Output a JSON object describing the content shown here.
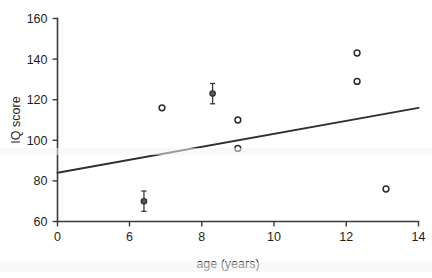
{
  "chart_data": {
    "type": "scatter",
    "title": "",
    "xlabel": "age (years)",
    "ylabel": "IQ score",
    "xlim": [
      0,
      14
    ],
    "ylim": [
      60,
      160
    ],
    "grid": false,
    "legend": "none",
    "x_axis_break": true,
    "xticks": [
      {
        "value": 0,
        "label": "0"
      },
      {
        "value": 6,
        "label": "6"
      },
      {
        "value": 8,
        "label": "8"
      },
      {
        "value": 10,
        "label": "10"
      },
      {
        "value": 12,
        "label": "12"
      },
      {
        "value": 14,
        "label": "14"
      }
    ],
    "yticks": [
      {
        "value": 160,
        "label": "160"
      },
      {
        "value": 140,
        "label": "140"
      },
      {
        "value": 120,
        "label": "120"
      },
      {
        "value": 100,
        "label": "100"
      },
      {
        "value": 80,
        "label": "80"
      },
      {
        "value": 60,
        "label": "60"
      }
    ],
    "series": [
      {
        "name": "observations",
        "marker": "open-circle",
        "points": [
          {
            "x": 6.9,
            "y": 116
          },
          {
            "x": 9.0,
            "y": 110
          },
          {
            "x": 9.0,
            "y": 96
          },
          {
            "x": 12.3,
            "y": 143
          },
          {
            "x": 12.3,
            "y": 129
          },
          {
            "x": 13.1,
            "y": 76
          }
        ]
      },
      {
        "name": "observations-with-error-bars",
        "marker": "filled-circle",
        "points": [
          {
            "x": 6.4,
            "y": 70,
            "yerr": 5
          },
          {
            "x": 8.3,
            "y": 123,
            "yerr": 5
          }
        ]
      }
    ],
    "trendline": {
      "name": "regression-line",
      "x0": 0,
      "y0": 84,
      "x1": 14,
      "y1": 116
    },
    "colors": {
      "axis": "#3b3b3b",
      "marker": "#2b2b2b",
      "marker_fill": "#5a5a5a",
      "line": "#2f2f2f",
      "background": "#ffffff"
    }
  }
}
